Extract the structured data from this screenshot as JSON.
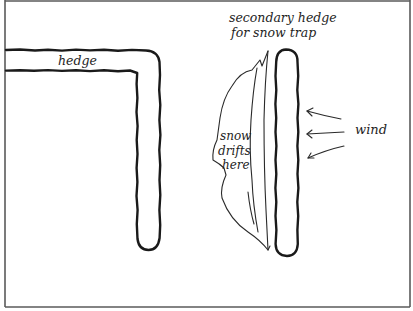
{
  "diagram": {
    "labels": {
      "hedge": "hedge",
      "secondary_line1": "secondary hedge",
      "secondary_line2": "for snow trap",
      "snow_line1": "snow",
      "snow_line2": "drifts",
      "snow_line3": "here",
      "wind": "wind"
    },
    "elements": [
      {
        "id": "main-hedge",
        "shape": "L-shaped hedge",
        "label": "hedge"
      },
      {
        "id": "secondary-hedge",
        "shape": "vertical hedge strip",
        "label": "secondary hedge for snow trap"
      },
      {
        "id": "snow-drift",
        "shape": "drift outline on leeward side",
        "label": "snow drifts here"
      },
      {
        "id": "wind-arrows",
        "count": 3,
        "direction": "right-to-left",
        "label": "wind"
      }
    ],
    "colors": {
      "ink": "#1a1a1a",
      "frame": "#5a5a5a",
      "background": "#ffffff"
    }
  }
}
